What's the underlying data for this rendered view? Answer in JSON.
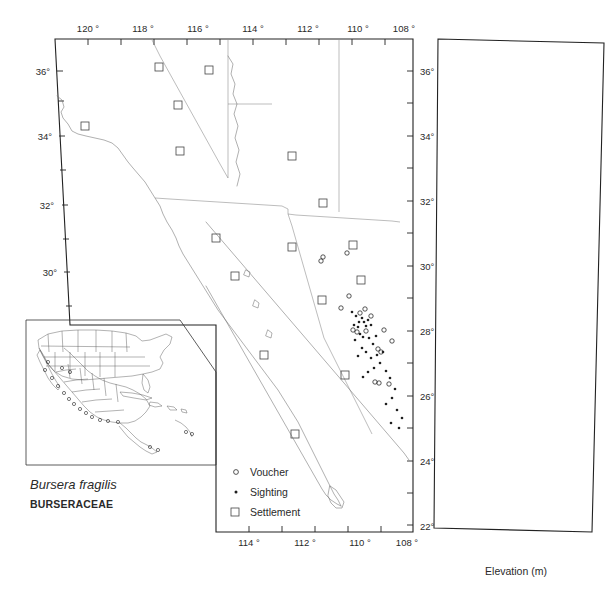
{
  "figure": {
    "species_name": "Bursera fragilis",
    "family_name": "BURSERACEAE"
  },
  "legend": {
    "items": [
      {
        "symbol": "open-circle",
        "label": "Voucher"
      },
      {
        "symbol": "filled-dot",
        "label": "Sighting"
      },
      {
        "symbol": "open-square",
        "label": "Settlement"
      }
    ]
  },
  "map_panel": {
    "lon_axis_top": [
      "120 °",
      "118 °",
      "116 °",
      "114 °",
      "112 °",
      "110 °",
      "108 °"
    ],
    "lon_axis_bottom": [
      "114 °",
      "112 °",
      "110 °",
      "108 °"
    ],
    "lat_axis_left": [
      "36°",
      "34°",
      "32°",
      "30°"
    ],
    "lat_axis_right": [
      "36°",
      "34°",
      "32°",
      "30°",
      "28°",
      "26°",
      "24°",
      "22°"
    ]
  },
  "elevation_panel": {
    "axis_title": "Elevation (m)",
    "x_ticks": [
      "0",
      "400",
      "800",
      "1200",
      "1600",
      "2000"
    ],
    "y_ticks": [
      "36°",
      "34°",
      "32°",
      "30°",
      "28°",
      "26°",
      "24°",
      "22°"
    ]
  },
  "chart_data": {
    "type": "scatter",
    "xlabel": "Elevation (m)",
    "ylabel": "Latitude (°N)",
    "xlim": [
      0,
      2000
    ],
    "ylim": [
      22,
      37
    ],
    "grid": true,
    "legend_position": "map-lower-center",
    "x_ticks": [
      0,
      400,
      800,
      1200,
      1600,
      2000
    ],
    "y_ticks": [
      22,
      24,
      26,
      28,
      30,
      32,
      34,
      36
    ],
    "series": [
      {
        "name": "Voucher",
        "marker": "open-circle",
        "points": [
          [
            620,
            30.55
          ],
          [
            700,
            30.5
          ],
          [
            1060,
            30.55
          ],
          [
            1160,
            30.5
          ],
          [
            600,
            29.2
          ],
          [
            720,
            29.2
          ],
          [
            840,
            29.05
          ],
          [
            660,
            28.95
          ],
          [
            520,
            28.5
          ],
          [
            560,
            28.45
          ],
          [
            740,
            28.45
          ],
          [
            300,
            28.5
          ],
          [
            340,
            28.35
          ],
          [
            620,
            28.3
          ],
          [
            760,
            28.3
          ],
          [
            700,
            28.25
          ],
          [
            260,
            28.05
          ],
          [
            430,
            27.95
          ],
          [
            300,
            27.3
          ],
          [
            240,
            27.25
          ],
          [
            900,
            26.95
          ],
          [
            230,
            26.6
          ]
        ]
      },
      {
        "name": "Sighting",
        "marker": "filled-dot",
        "points": [
          [
            560,
            28.6
          ],
          [
            600,
            28.55
          ],
          [
            620,
            28.5
          ],
          [
            640,
            28.5
          ],
          [
            580,
            28.4
          ],
          [
            600,
            28.35
          ],
          [
            660,
            28.4
          ],
          [
            680,
            28.35
          ],
          [
            500,
            28.3
          ],
          [
            520,
            28.25
          ],
          [
            540,
            28.2
          ],
          [
            700,
            28.3
          ],
          [
            720,
            28.25
          ],
          [
            740,
            28.2
          ],
          [
            450,
            28.1
          ],
          [
            470,
            28.05
          ],
          [
            380,
            27.85
          ],
          [
            400,
            27.8
          ],
          [
            330,
            27.5
          ],
          [
            350,
            27.45
          ],
          [
            280,
            27.2
          ],
          [
            300,
            27.15
          ],
          [
            320,
            27.1
          ],
          [
            900,
            26.9
          ]
        ]
      }
    ]
  },
  "map_points": {
    "voucher": [
      [
        323,
        257
      ],
      [
        321,
        261
      ],
      [
        347,
        253
      ],
      [
        349,
        296
      ],
      [
        341,
        308
      ],
      [
        365,
        309
      ],
      [
        360,
        313
      ],
      [
        371,
        316
      ],
      [
        353,
        330
      ],
      [
        357,
        332
      ],
      [
        366,
        331
      ],
      [
        384,
        330
      ],
      [
        378,
        349
      ],
      [
        381,
        352
      ],
      [
        392,
        341
      ],
      [
        375,
        382
      ],
      [
        379,
        383
      ],
      [
        389,
        384
      ]
    ],
    "sighting": [
      [
        352,
        312
      ],
      [
        356,
        316
      ],
      [
        362,
        318
      ],
      [
        359,
        322
      ],
      [
        364,
        322
      ],
      [
        368,
        320
      ],
      [
        354,
        325
      ],
      [
        358,
        327
      ],
      [
        366,
        326
      ],
      [
        371,
        325
      ],
      [
        360,
        334
      ],
      [
        363,
        337
      ],
      [
        355,
        340
      ],
      [
        369,
        338
      ],
      [
        376,
        336
      ],
      [
        373,
        344
      ],
      [
        362,
        348
      ],
      [
        366,
        352
      ],
      [
        358,
        356
      ],
      [
        371,
        358
      ],
      [
        377,
        355
      ],
      [
        383,
        352
      ],
      [
        380,
        363
      ],
      [
        374,
        368
      ],
      [
        368,
        372
      ],
      [
        363,
        377
      ],
      [
        386,
        371
      ],
      [
        390,
        378
      ],
      [
        395,
        389
      ],
      [
        392,
        398
      ],
      [
        386,
        404
      ],
      [
        397,
        410
      ],
      [
        402,
        418
      ],
      [
        391,
        423
      ],
      [
        399,
        428
      ]
    ],
    "settlement": [
      [
        159,
        67
      ],
      [
        209,
        70
      ],
      [
        180,
        151
      ],
      [
        292,
        156
      ],
      [
        85,
        126
      ],
      [
        178,
        105
      ],
      [
        323,
        203
      ],
      [
        353,
        245
      ],
      [
        216,
        238
      ],
      [
        292,
        247
      ],
      [
        361,
        280
      ],
      [
        322,
        300
      ],
      [
        235,
        276
      ],
      [
        264,
        355
      ],
      [
        345,
        375
      ],
      [
        295,
        434
      ]
    ]
  }
}
